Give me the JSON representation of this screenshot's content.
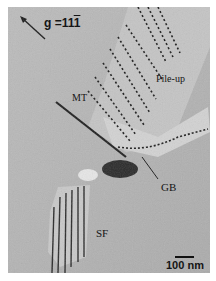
{
  "figure": {
    "diffraction_vector": {
      "prefix": "g =",
      "digits": "11",
      "barred_digit": "1"
    },
    "annotations": {
      "pile_up": "Pile-up",
      "mt": "MT",
      "gb": "GB",
      "sf": "SF"
    },
    "scale_bar": {
      "label": "100 nm"
    },
    "colors": {
      "background": "#b4b4b4",
      "dislocation": "#1a1a1a",
      "highlight": "#e6e6e6"
    }
  }
}
